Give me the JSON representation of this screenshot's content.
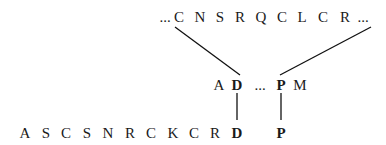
{
  "top_sequence": {
    "leading_ellipsis": "...",
    "residues": [
      "C",
      "N",
      "S",
      "R",
      "Q",
      "C",
      "L",
      "C",
      "R"
    ],
    "trailing_ellipsis": "..."
  },
  "middle_sequence": {
    "residues": [
      {
        "letter": "A",
        "bold": false
      },
      {
        "letter": "D",
        "bold": true
      },
      {
        "letter": "...",
        "bold": false
      },
      {
        "letter": "P",
        "bold": true
      },
      {
        "letter": "M",
        "bold": false
      }
    ]
  },
  "bottom_sequence": {
    "residues": [
      {
        "letter": "A",
        "bold": false
      },
      {
        "letter": "S",
        "bold": false
      },
      {
        "letter": "C",
        "bold": false
      },
      {
        "letter": "S",
        "bold": false
      },
      {
        "letter": "N",
        "bold": false
      },
      {
        "letter": "R",
        "bold": false
      },
      {
        "letter": "C",
        "bold": false
      },
      {
        "letter": "K",
        "bold": false
      },
      {
        "letter": "C",
        "bold": false
      },
      {
        "letter": "R",
        "bold": false
      },
      {
        "letter": "D",
        "bold": true
      },
      {
        "letter": "P",
        "bold": true
      }
    ]
  }
}
